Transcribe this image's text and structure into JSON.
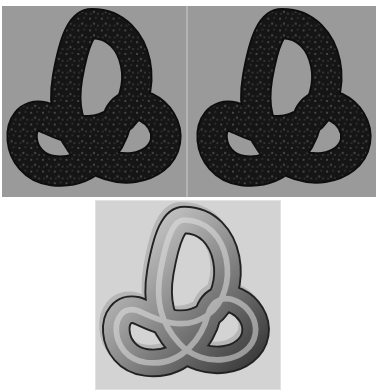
{
  "figure": {
    "panels": [
      {
        "id": "top-left",
        "subject": "trefoil-knot",
        "material": "dark speckled granite texture",
        "background": "#9a9a9a"
      },
      {
        "id": "top-right",
        "subject": "trefoil-knot",
        "material": "dark speckled granite texture",
        "background": "#9a9a9a"
      },
      {
        "id": "bottom",
        "subject": "trefoil-knot",
        "material": "smooth gray shaded tube with drop shadow",
        "background": "#d3d3d3"
      }
    ],
    "colors": {
      "dark_knot": "#141414",
      "speckle": "#6a6a6a",
      "gray_knot_light": "#cfcfcf",
      "gray_knot_dark": "#3a3a3a",
      "shadow": "#a8a8a8"
    }
  }
}
